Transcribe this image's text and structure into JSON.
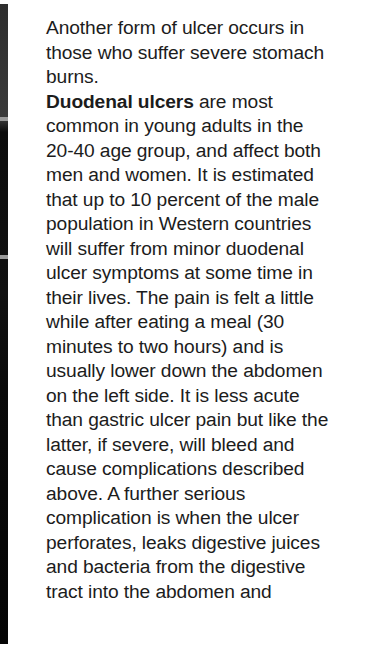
{
  "document": {
    "paragraphs": [
      {
        "lines": [
          "Another form of ulcer occurs in",
          "those who suffer severe stomach",
          "burns."
        ]
      },
      {
        "lead_bold": "Duodenal ulcers",
        "first_line_rest": " are most",
        "lines": [
          "common in young adults in the",
          "20-40 age group, and affect both",
          "men and women. It is estimated",
          "that up to 10 percent of the male",
          "population in Western countries",
          "will suffer from minor duodenal",
          "ulcer symptoms at some time in",
          "their lives. The pain is felt a little",
          "while after eating a meal (30",
          "minutes to two hours) and is",
          "usually lower down the abdomen",
          "on the left side. It is less acute",
          "than gastric ulcer pain but like the",
          "latter, if severe, will bleed and",
          "cause complications described",
          "above. A further serious",
          "complication is when the ulcer",
          "perforates, leaks digestive juices",
          "and bacteria from the digestive",
          "tract into the abdomen and"
        ]
      }
    ]
  }
}
